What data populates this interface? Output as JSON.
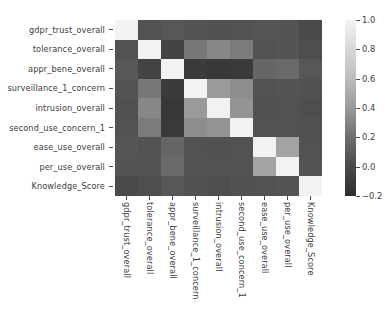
{
  "chart_data": {
    "type": "heatmap",
    "title": "",
    "xlabel": "",
    "ylabel": "",
    "grid": false,
    "legend_position": "right",
    "colormap": "gray",
    "colorbar": {
      "ticks": [
        "1.0",
        "0.8",
        "0.6",
        "0.4",
        "0.2",
        "0.0",
        "−0.2"
      ],
      "vmin": -0.3,
      "vmax": 1.0
    },
    "categories": [
      "gdpr_trust_overall",
      "tolerance_overall",
      "appr_bene_overall",
      "surveillance_1_concern",
      "intrusion_overall",
      "second_use_concern_1",
      "ease_use_overall",
      "per_use_overall",
      "Knowledge_Score"
    ],
    "x_tick_labels": [
      "gdpr_trust_overall",
      "tolerance_overall",
      "appr_bene_overall",
      "surveillance_1_concern",
      "intrusion_overall",
      "second_use_concern_1",
      "ease_use_overall",
      "per_use_overall",
      "Knowledge_Score"
    ],
    "y_tick_labels": [
      "gdpr_trust_overall",
      "tolerance_overall",
      "appr_bene_overall",
      "surveillance_1_concern",
      "intrusion_overall",
      "second_use_concern_1",
      "ease_use_overall",
      "per_use_overall",
      "Knowledge_Score"
    ],
    "values": [
      [
        1.0,
        -0.05,
        -0.02,
        -0.04,
        -0.06,
        -0.05,
        -0.03,
        -0.04,
        -0.1
      ],
      [
        -0.05,
        1.0,
        -0.14,
        0.2,
        0.3,
        0.22,
        -0.05,
        -0.04,
        -0.08
      ],
      [
        -0.02,
        -0.14,
        1.0,
        -0.2,
        -0.22,
        -0.21,
        0.08,
        0.1,
        -0.02
      ],
      [
        -0.04,
        0.2,
        -0.2,
        1.0,
        0.42,
        0.34,
        -0.05,
        -0.04,
        -0.06
      ],
      [
        -0.06,
        0.3,
        -0.22,
        0.42,
        1.0,
        0.38,
        -0.06,
        -0.05,
        -0.08
      ],
      [
        -0.05,
        0.22,
        -0.21,
        0.34,
        0.38,
        1.0,
        -0.05,
        -0.05,
        -0.06
      ],
      [
        -0.03,
        -0.05,
        0.08,
        -0.05,
        -0.06,
        -0.05,
        1.0,
        0.48,
        -0.05
      ],
      [
        -0.04,
        -0.04,
        0.1,
        -0.04,
        -0.05,
        -0.05,
        0.48,
        1.0,
        -0.04
      ],
      [
        -0.1,
        -0.08,
        -0.02,
        -0.06,
        -0.08,
        -0.06,
        -0.05,
        -0.04,
        1.0
      ]
    ]
  }
}
